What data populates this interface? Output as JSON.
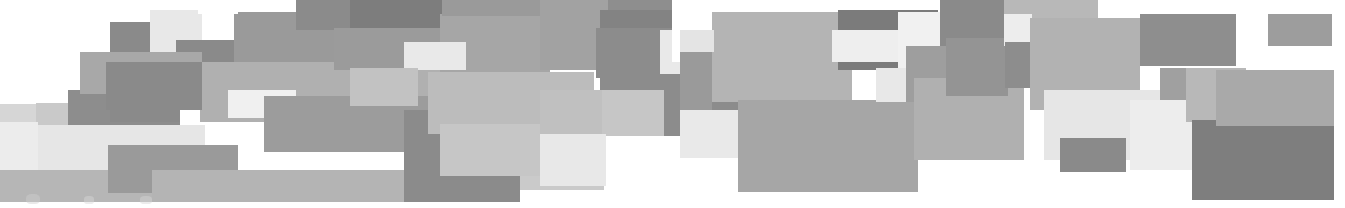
{
  "figure": {
    "width": 1345,
    "height": 208,
    "background": "#ffffff"
  },
  "palette": {
    "white": "#ffffff",
    "near_white": "#f0f0f0",
    "very_light": "#e4e4e4",
    "light": "#d2d2d2",
    "light_mid": "#c3c3c3",
    "mid": "#b3b3b3",
    "mid_dark": "#a3a3a3",
    "dark_mid": "#949494",
    "dark": "#868686",
    "darker": "#787878",
    "darkest": "#6e6e6e"
  },
  "tiles": [
    {
      "id": 1,
      "x": 0,
      "y": 0,
      "w": 36,
      "h": 104,
      "fill": "#ffffff"
    },
    {
      "id": 2,
      "x": 36,
      "y": 103,
      "w": 96,
      "h": 22,
      "fill": "#c9c9c9"
    },
    {
      "id": 3,
      "x": 36,
      "y": 125,
      "w": 169,
      "h": 45,
      "fill": "#e6e6e6"
    },
    {
      "id": 4,
      "x": 36,
      "y": 170,
      "w": 152,
      "h": 32,
      "fill": "#b6b6b6"
    },
    {
      "id": 5,
      "x": 68,
      "y": 90,
      "w": 112,
      "h": 35,
      "fill": "#8d8d8d"
    },
    {
      "id": 6,
      "x": 110,
      "y": 22,
      "w": 70,
      "h": 100,
      "fill": "#8a8a8a"
    },
    {
      "id": 7,
      "x": 108,
      "y": 145,
      "w": 130,
      "h": 48,
      "fill": "#9a9a9a"
    },
    {
      "id": 8,
      "x": 132,
      "y": 0,
      "w": 68,
      "h": 22,
      "fill": "#ffffff"
    },
    {
      "id": 9,
      "x": 152,
      "y": 170,
      "w": 300,
      "h": 32,
      "fill": "#b4b4b4"
    },
    {
      "id": 10,
      "x": 180,
      "y": 0,
      "w": 54,
      "h": 40,
      "fill": "#ffffff"
    },
    {
      "id": 11,
      "x": 150,
      "y": 10,
      "w": 52,
      "h": 52,
      "fill": "#e8e8e8"
    },
    {
      "id": 12,
      "x": 176,
      "y": 40,
      "w": 100,
      "h": 40,
      "fill": "#8a8a8a"
    },
    {
      "id": 13,
      "x": 80,
      "y": 52,
      "w": 122,
      "h": 42,
      "fill": "#a8a8a8"
    },
    {
      "id": 14,
      "x": 234,
      "y": 12,
      "w": 100,
      "h": 56,
      "fill": "#9a9a9a"
    },
    {
      "id": 15,
      "x": 200,
      "y": 62,
      "w": 240,
      "h": 60,
      "fill": "#b0b0b0"
    },
    {
      "id": 16,
      "x": 106,
      "y": 62,
      "w": 96,
      "h": 48,
      "fill": "#8a8a8a"
    },
    {
      "id": 17,
      "x": 228,
      "y": 90,
      "w": 68,
      "h": 28,
      "fill": "#f0f0f0"
    },
    {
      "id": 18,
      "x": 264,
      "y": 96,
      "w": 190,
      "h": 56,
      "fill": "#9c9c9c"
    },
    {
      "id": 19,
      "x": 296,
      "y": 0,
      "w": 150,
      "h": 30,
      "fill": "#8b8b8b"
    },
    {
      "id": 20,
      "x": 334,
      "y": 28,
      "w": 112,
      "h": 42,
      "fill": "#9b9b9b"
    },
    {
      "id": 21,
      "x": 350,
      "y": 0,
      "w": 96,
      "h": 28,
      "fill": "#7d7d7d"
    },
    {
      "id": 22,
      "x": 404,
      "y": 110,
      "w": 116,
      "h": 92,
      "fill": "#8b8b8b"
    },
    {
      "id": 23,
      "x": 440,
      "y": 14,
      "w": 110,
      "h": 58,
      "fill": "#a6a6a6"
    },
    {
      "id": 24,
      "x": 404,
      "y": 42,
      "w": 62,
      "h": 28,
      "fill": "#e9e9e9"
    },
    {
      "id": 25,
      "x": 350,
      "y": 68,
      "w": 68,
      "h": 38,
      "fill": "#c2c2c2"
    },
    {
      "id": 26,
      "x": 428,
      "y": 72,
      "w": 166,
      "h": 62,
      "fill": "#bcbcbc"
    },
    {
      "id": 27,
      "x": 442,
      "y": 0,
      "w": 100,
      "h": 16,
      "fill": "#9a9a9a"
    },
    {
      "id": 28,
      "x": 520,
      "y": 128,
      "w": 84,
      "h": 62,
      "fill": "#cacaca"
    },
    {
      "id": 29,
      "x": 440,
      "y": 124,
      "w": 160,
      "h": 52,
      "fill": "#c6c6c6"
    },
    {
      "id": 30,
      "x": 596,
      "y": 0,
      "w": 120,
      "h": 28,
      "fill": "#8e8e8e"
    },
    {
      "id": 31,
      "x": 540,
      "y": 0,
      "w": 68,
      "h": 70,
      "fill": "#a2a2a2"
    },
    {
      "id": 32,
      "x": 600,
      "y": 10,
      "w": 130,
      "h": 36,
      "fill": "#838383"
    },
    {
      "id": 33,
      "x": 610,
      "y": 44,
      "w": 66,
      "h": 30,
      "fill": "#e6e6e6"
    },
    {
      "id": 34,
      "x": 596,
      "y": 28,
      "w": 120,
      "h": 50,
      "fill": "#8c8c8c"
    },
    {
      "id": 35,
      "x": 660,
      "y": 30,
      "w": 50,
      "h": 44,
      "fill": "#e9e9e9"
    },
    {
      "id": 36,
      "x": 600,
      "y": 74,
      "w": 140,
      "h": 62,
      "fill": "#8c8c8c"
    },
    {
      "id": 37,
      "x": 596,
      "y": 90,
      "w": 68,
      "h": 46,
      "fill": "#c6c6c6"
    },
    {
      "id": 38,
      "x": 540,
      "y": 90,
      "w": 62,
      "h": 46,
      "fill": "#c0c0c0"
    },
    {
      "id": 39,
      "x": 540,
      "y": 134,
      "w": 66,
      "h": 52,
      "fill": "#e8e8e8"
    },
    {
      "id": 40,
      "x": 672,
      "y": 0,
      "w": 44,
      "h": 62,
      "fill": "#ffffff"
    },
    {
      "id": 41,
      "x": 714,
      "y": 0,
      "w": 86,
      "h": 14,
      "fill": "#ffffff"
    },
    {
      "id": 42,
      "x": 680,
      "y": 110,
      "w": 130,
      "h": 48,
      "fill": "#e9e9e9"
    },
    {
      "id": 43,
      "x": 680,
      "y": 32,
      "w": 32,
      "h": 78,
      "fill": "#9a9a9a"
    },
    {
      "id": 44,
      "x": 712,
      "y": 12,
      "w": 140,
      "h": 90,
      "fill": "#b4b4b4"
    },
    {
      "id": 45,
      "x": 680,
      "y": 30,
      "w": 34,
      "h": 22,
      "fill": "#e4e4e4"
    },
    {
      "id": 46,
      "x": 738,
      "y": 100,
      "w": 180,
      "h": 92,
      "fill": "#a6a6a6"
    },
    {
      "id": 47,
      "x": 838,
      "y": 10,
      "w": 100,
      "h": 60,
      "fill": "#7b7b7b"
    },
    {
      "id": 48,
      "x": 832,
      "y": 30,
      "w": 68,
      "h": 32,
      "fill": "#eeeeee"
    },
    {
      "id": 49,
      "x": 876,
      "y": 68,
      "w": 38,
      "h": 34,
      "fill": "#e8e8e8"
    },
    {
      "id": 50,
      "x": 898,
      "y": 12,
      "w": 56,
      "h": 56,
      "fill": "#f1f1f1"
    },
    {
      "id": 51,
      "x": 906,
      "y": 46,
      "w": 60,
      "h": 56,
      "fill": "#9e9e9e"
    },
    {
      "id": 52,
      "x": 914,
      "y": 78,
      "w": 110,
      "h": 82,
      "fill": "#b0b0b0"
    },
    {
      "id": 53,
      "x": 940,
      "y": 0,
      "w": 66,
      "h": 46,
      "fill": "#8a8a8a"
    },
    {
      "id": 54,
      "x": 946,
      "y": 38,
      "w": 62,
      "h": 58,
      "fill": "#949494"
    },
    {
      "id": 55,
      "x": 1004,
      "y": 0,
      "w": 94,
      "h": 46,
      "fill": "#b8b8b8"
    },
    {
      "id": 56,
      "x": 1004,
      "y": 14,
      "w": 28,
      "h": 32,
      "fill": "#ededed"
    },
    {
      "id": 57,
      "x": 1005,
      "y": 42,
      "w": 28,
      "h": 46,
      "fill": "#8d8d8d"
    },
    {
      "id": 58,
      "x": 1030,
      "y": 18,
      "w": 110,
      "h": 92,
      "fill": "#b2b2b2"
    },
    {
      "id": 59,
      "x": 1044,
      "y": 90,
      "w": 140,
      "h": 70,
      "fill": "#e6e6e6"
    },
    {
      "id": 60,
      "x": 1140,
      "y": 14,
      "w": 96,
      "h": 52,
      "fill": "#8e8e8e"
    },
    {
      "id": 61,
      "x": 1160,
      "y": 68,
      "w": 80,
      "h": 52,
      "fill": "#a0a0a0"
    },
    {
      "id": 62,
      "x": 1060,
      "y": 138,
      "w": 66,
      "h": 34,
      "fill": "#8a8a8a"
    },
    {
      "id": 63,
      "x": 1130,
      "y": 100,
      "w": 66,
      "h": 70,
      "fill": "#ededed"
    },
    {
      "id": 64,
      "x": 1186,
      "y": 68,
      "w": 60,
      "h": 54,
      "fill": "#b8b8b8"
    },
    {
      "id": 65,
      "x": 1192,
      "y": 120,
      "w": 142,
      "h": 80,
      "fill": "#7e7e7e"
    },
    {
      "id": 66,
      "x": 1216,
      "y": 70,
      "w": 118,
      "h": 56,
      "fill": "#a9a9a9"
    },
    {
      "id": 67,
      "x": 1268,
      "y": 14,
      "w": 64,
      "h": 32,
      "fill": "#9d9d9d"
    },
    {
      "id": 68,
      "x": 1100,
      "y": 0,
      "w": 40,
      "h": 14,
      "fill": "#ffffff"
    },
    {
      "id": 69,
      "x": 0,
      "y": 104,
      "w": 36,
      "h": 18,
      "fill": "#d6d6d6"
    },
    {
      "id": 70,
      "x": 0,
      "y": 122,
      "w": 38,
      "h": 48,
      "fill": "#ececec"
    },
    {
      "id": 71,
      "x": 0,
      "y": 170,
      "w": 38,
      "h": 32,
      "fill": "#b6b6b6"
    },
    {
      "id": 72,
      "x": 198,
      "y": 0,
      "w": 40,
      "h": 14,
      "fill": "#ffffff"
    }
  ],
  "smudges": [
    {
      "id": "s1",
      "x": 26,
      "y": 194,
      "w": 14,
      "h": 10,
      "fill": "#cfcfcf"
    },
    {
      "id": "s2",
      "x": 84,
      "y": 196,
      "w": 10,
      "h": 8,
      "fill": "#d8d8d8"
    },
    {
      "id": "s3",
      "x": 140,
      "y": 196,
      "w": 12,
      "h": 8,
      "fill": "#d4d4d4"
    }
  ]
}
